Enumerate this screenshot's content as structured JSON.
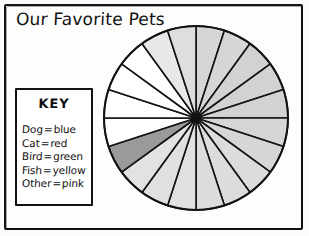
{
  "poster": {
    "title": "Our Favorite Pets",
    "background_color": "#fdfdfc",
    "ink_color": "#121212"
  },
  "key": {
    "heading": "KEY",
    "separator": "=",
    "entries": [
      {
        "label": "Dog",
        "value": "blue",
        "swatch_color": "#d9d9d9"
      },
      {
        "label": "Cat",
        "value": "red",
        "swatch_color": "#d2d2d2"
      },
      {
        "label": "Bird",
        "value": "green",
        "swatch_color": "#ffffff"
      },
      {
        "label": "Fish",
        "value": "yellow",
        "swatch_color": "#e4e4e4"
      },
      {
        "label": "Other",
        "value": "pink",
        "swatch_color": "#9a9a9a"
      }
    ]
  },
  "chart_data": {
    "type": "pie",
    "title": "Our Favorite Pets",
    "xlabel": "",
    "ylabel": "",
    "total_slices": 20,
    "slice_angle_degrees": 18,
    "start_angle_degrees": -90,
    "direction": "clockwise",
    "center": {
      "x": 93,
      "y": 94
    },
    "radius": 92,
    "stroke_color": "#121212",
    "stroke_width": 1.6,
    "legend_position": "left",
    "grid": false,
    "categories": [
      "Dog",
      "Cat",
      "Bird",
      "Fish",
      "Other"
    ],
    "category_colors": {
      "Dog": "#d9d9d9",
      "Cat": "#d2d2d2",
      "Bird": "#ffffff",
      "Fish": "#e4e4e4",
      "Other": "#9a9a9a"
    },
    "category_counts": {
      "Dog": 7,
      "Cat": 4,
      "Bird": 5,
      "Fish": 3,
      "Other": 1
    },
    "values": [
      7,
      4,
      5,
      3,
      1
    ],
    "slices": [
      {
        "index": 0,
        "start": -90,
        "end": -72,
        "fill": "#d6d6d6"
      },
      {
        "index": 1,
        "start": -72,
        "end": -54,
        "fill": "#d6d6d6"
      },
      {
        "index": 2,
        "start": -54,
        "end": -36,
        "fill": "#d2d2d2"
      },
      {
        "index": 3,
        "start": -36,
        "end": -18,
        "fill": "#d2d2d2"
      },
      {
        "index": 4,
        "start": -18,
        "end": 0,
        "fill": "#d2d2d2"
      },
      {
        "index": 5,
        "start": 0,
        "end": 18,
        "fill": "#d6d6d6"
      },
      {
        "index": 6,
        "start": 18,
        "end": 36,
        "fill": "#d6d6d6"
      },
      {
        "index": 7,
        "start": 36,
        "end": 54,
        "fill": "#dcdcdc"
      },
      {
        "index": 8,
        "start": 54,
        "end": 72,
        "fill": "#dcdcdc"
      },
      {
        "index": 9,
        "start": 72,
        "end": 90,
        "fill": "#dcdcdc"
      },
      {
        "index": 10,
        "start": 90,
        "end": 108,
        "fill": "#e0e0e0"
      },
      {
        "index": 11,
        "start": 108,
        "end": 126,
        "fill": "#e0e0e0"
      },
      {
        "index": 12,
        "start": 126,
        "end": 144,
        "fill": "#e2e2e2"
      },
      {
        "index": 13,
        "start": 144,
        "end": 162,
        "fill": "#9a9a9a"
      },
      {
        "index": 14,
        "start": 162,
        "end": 180,
        "fill": "#ffffff"
      },
      {
        "index": 15,
        "start": 180,
        "end": 198,
        "fill": "#ffffff"
      },
      {
        "index": 16,
        "start": 198,
        "end": 216,
        "fill": "#ffffff"
      },
      {
        "index": 17,
        "start": 216,
        "end": 234,
        "fill": "#ffffff"
      },
      {
        "index": 18,
        "start": 234,
        "end": 252,
        "fill": "#e8e8e8"
      },
      {
        "index": 19,
        "start": 252,
        "end": 270,
        "fill": "#dedede"
      }
    ]
  }
}
